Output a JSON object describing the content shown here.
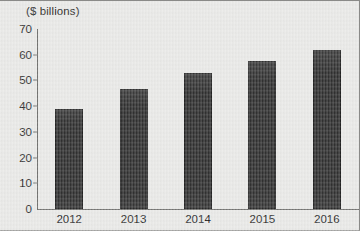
{
  "chart_data": {
    "type": "bar",
    "title": "",
    "subtitle": "",
    "xlabel": "",
    "ylabel": "($ billions)",
    "categories": [
      "2012",
      "2013",
      "2014",
      "2015",
      "2016"
    ],
    "values": [
      39,
      46.5,
      53,
      57.5,
      62
    ],
    "series": [
      {
        "name": "",
        "values": [
          39,
          46.5,
          53,
          57.5,
          62
        ]
      }
    ],
    "ylim": [
      0,
      70
    ],
    "y_ticks": [
      0,
      10,
      20,
      30,
      40,
      50,
      60,
      70
    ],
    "y_tick_labels": [
      "0",
      "10",
      "20",
      "30",
      "40",
      "50",
      "60",
      "70"
    ],
    "grid": false,
    "legend": false,
    "legend_position": "none",
    "annotations": []
  },
  "style": {
    "bar_color": "#2b2b2b",
    "background_color": "#e9e9e7",
    "axis_color": "#6f6f6d",
    "text_color": "#1d1d1d"
  }
}
